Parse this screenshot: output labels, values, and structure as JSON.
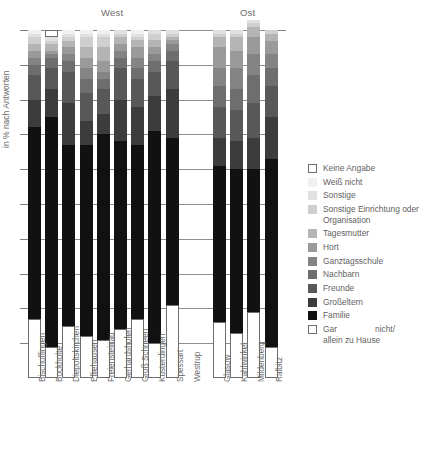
{
  "groups": [
    {
      "name": "West",
      "label": "West"
    },
    {
      "name": "Ost",
      "label": "Ost"
    }
  ],
  "axis": {
    "ylabel": "in % nach Antworten"
  },
  "legend": [
    {
      "label": "Keine Angabe",
      "color": "#ffffff",
      "bordered": true
    },
    {
      "label": "Weiß nicht",
      "color": "#f0f0f0",
      "bordered": false
    },
    {
      "label": "Sonstige",
      "color": "#e0e0e0",
      "bordered": false
    },
    {
      "label": "Sonstige Einrichtung oder Organisation",
      "color": "#cfcfcf",
      "bordered": false
    },
    {
      "label": "Tagesmutter",
      "color": "#b4b4b4",
      "bordered": false
    },
    {
      "label": "Hort",
      "color": "#9a9a9a",
      "bordered": false
    },
    {
      "label": "Ganztagsschule",
      "color": "#848484",
      "bordered": false
    },
    {
      "label": "Nachbarn",
      "color": "#6e6e6e",
      "bordered": false
    },
    {
      "label": "Freunde",
      "color": "#585858",
      "bordered": false
    },
    {
      "label": "Großeltern",
      "color": "#3c3c3c",
      "bordered": false
    },
    {
      "label": "Familie",
      "color": "#111111",
      "bordered": false
    },
    {
      "label": "Gar nicht/ allein zu Hause",
      "color": "#ffffff",
      "bordered": true
    }
  ],
  "chart_data": {
    "type": "bar",
    "title": "",
    "xlabel": "",
    "ylabel": "in % nach Antworten",
    "ylim": [
      0,
      100
    ],
    "grid": true,
    "stacked": true,
    "stack_percent": true,
    "legend_position": "right",
    "group_labels": [
      "West",
      "Ost"
    ],
    "group_membership": [
      "West",
      "West",
      "West",
      "West",
      "West",
      "West",
      "West",
      "West",
      "West",
      "West",
      "Ost",
      "Ost",
      "Ost",
      "Ost"
    ],
    "categories": [
      "Bischoffingen",
      "Bockholte",
      "Diepoltskirchen",
      "Elliehausen",
      "Freiensteinau",
      "Gerhardshofen",
      "Groß Schneen",
      "Kusterdingen",
      "Spessart",
      "Westrup",
      "Glasow",
      "Kahlwinkel",
      "Mildenberg",
      "Ralbitz"
    ],
    "stack_order_bottom_to_top": [
      "Gar nicht/ allein zu Hause",
      "Familie",
      "Großeltern",
      "Freunde",
      "Nachbarn",
      "Ganztagsschule",
      "Hort",
      "Tagesmutter",
      "Sonstige Einrichtung oder Organisation",
      "Sonstige",
      "Weiß nicht",
      "Keine Angabe"
    ],
    "series": [
      {
        "name": "Gar nicht/ allein zu Hause",
        "color": "#ffffff",
        "bordered": true,
        "values": [
          17,
          9,
          15,
          12,
          11,
          14,
          17,
          10,
          21,
          0,
          16,
          13,
          19,
          9
        ]
      },
      {
        "name": "Familie",
        "color": "#111111",
        "values": [
          55,
          66,
          52,
          55,
          59,
          54,
          50,
          61,
          48,
          0,
          45,
          47,
          41,
          54
        ]
      },
      {
        "name": "Großeltern",
        "color": "#3c3c3c",
        "values": [
          8,
          8,
          12,
          7,
          6,
          12,
          11,
          10,
          14,
          0,
          8,
          8,
          9,
          12
        ]
      },
      {
        "name": "Freunde",
        "color": "#585858",
        "values": [
          7,
          6,
          9,
          8,
          7,
          9,
          8,
          7,
          8,
          0,
          9,
          9,
          10,
          9
        ]
      },
      {
        "name": "Nachbarn",
        "color": "#6e6e6e",
        "values": [
          3,
          3,
          3,
          4,
          3,
          3,
          3,
          3,
          3,
          0,
          6,
          6,
          8,
          5
        ]
      },
      {
        "name": "Ganztagsschule",
        "color": "#848484",
        "values": [
          2,
          1,
          2,
          3,
          2,
          2,
          3,
          2,
          2,
          0,
          5,
          6,
          6,
          4
        ]
      },
      {
        "name": "Hort",
        "color": "#9a9a9a",
        "values": [
          2,
          1,
          2,
          3,
          3,
          2,
          3,
          2,
          1,
          0,
          6,
          5,
          5,
          4
        ]
      },
      {
        "name": "Tagesmutter",
        "color": "#b4b4b4",
        "values": [
          2,
          2,
          2,
          3,
          4,
          2,
          2,
          2,
          1,
          0,
          3,
          4,
          3,
          2
        ]
      },
      {
        "name": "Sonstige Einrichtung oder Organisation",
        "color": "#cfcfcf",
        "values": [
          2,
          1,
          1,
          3,
          3,
          1,
          1,
          2,
          1,
          0,
          1,
          1,
          1,
          1
        ]
      },
      {
        "name": "Sonstige",
        "color": "#e0e0e0",
        "values": [
          1,
          1,
          1,
          1,
          1,
          1,
          1,
          1,
          1,
          0,
          1,
          1,
          1,
          0
        ]
      },
      {
        "name": "Weiß nicht",
        "color": "#f0f0f0",
        "values": [
          1,
          0,
          1,
          1,
          1,
          0,
          1,
          0,
          0,
          0,
          0,
          0,
          0,
          0
        ]
      },
      {
        "name": "Keine Angabe",
        "color": "#ffffff",
        "bordered": true,
        "values": [
          0,
          2,
          0,
          0,
          0,
          0,
          0,
          0,
          0,
          0,
          0,
          0,
          0,
          0
        ]
      }
    ],
    "gridline_percents": [
      10,
      20,
      30,
      40,
      50,
      60,
      70,
      80,
      90,
      100
    ]
  }
}
